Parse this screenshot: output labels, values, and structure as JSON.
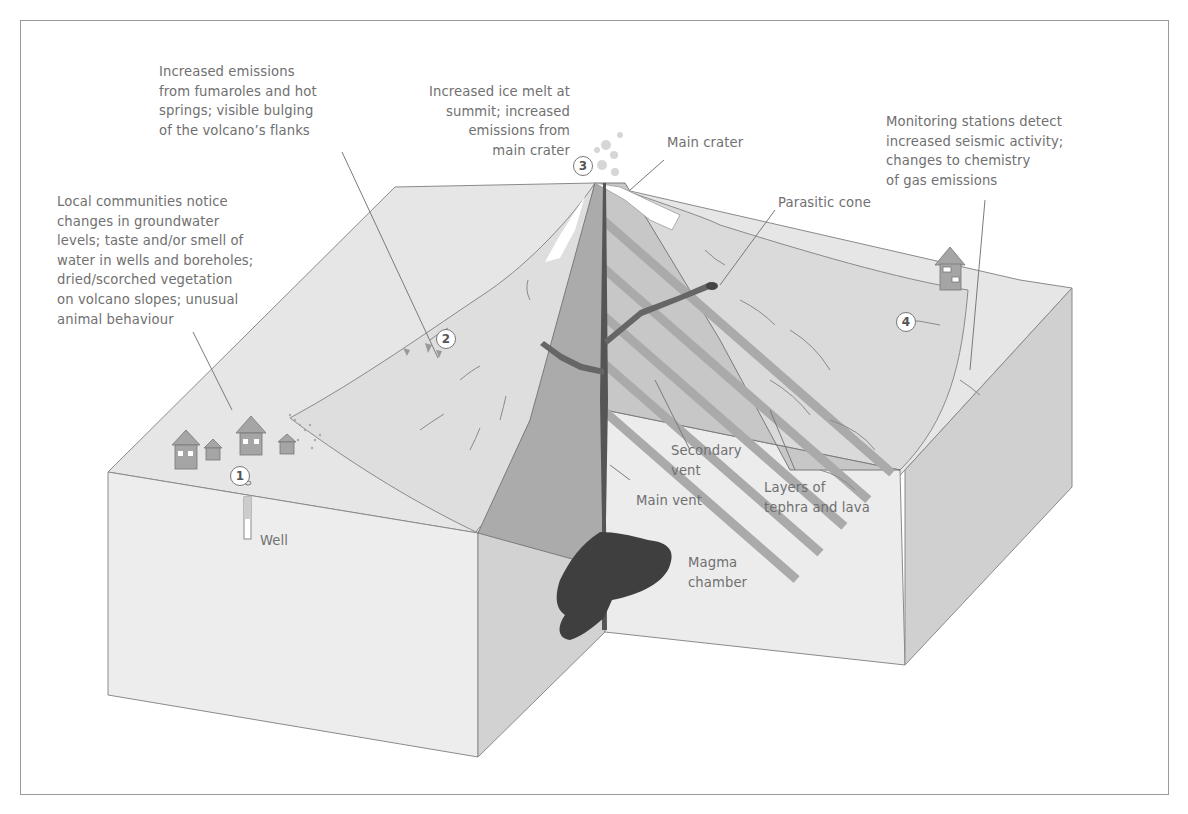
{
  "diagram": {
    "callouts": [
      {
        "number": "1",
        "text": "Local communities notice\nchanges in groundwater\nlevels; taste and/or smell of\nwater in wells and boreholes;\ndried/scorched vegetation\non volcano slopes; unusual\nanimal behaviour"
      },
      {
        "number": "2",
        "text": "Increased emissions\nfrom fumaroles and hot\nsprings; visible bulging\nof the volcano’s flanks"
      },
      {
        "number": "3",
        "text": "Increased ice melt at\nsummit; increased\nemissions from\nmain crater"
      },
      {
        "number": "4",
        "text": "Monitoring stations detect\nincreased seismic activity;\nchanges to chemistry\nof gas emissions"
      }
    ],
    "labels": {
      "main_crater": "Main crater",
      "parasitic_cone": "Parasitic cone",
      "secondary_vent": "Secondary\nvent",
      "main_vent": "Main vent",
      "layers": "Layers of\ntephra and lava",
      "magma_chamber": "Magma\nchamber",
      "well": "Well"
    },
    "colors": {
      "ground_top": "#e4e4e4",
      "slope": "#dcdcdc",
      "front_face": "#ececec",
      "side_face": "#cfcfcf",
      "cone_section": "#a9a9a9",
      "stripe": "#c8c8c8",
      "magma": "#3f3f3f",
      "line": "#888888",
      "text": "#707070"
    }
  }
}
